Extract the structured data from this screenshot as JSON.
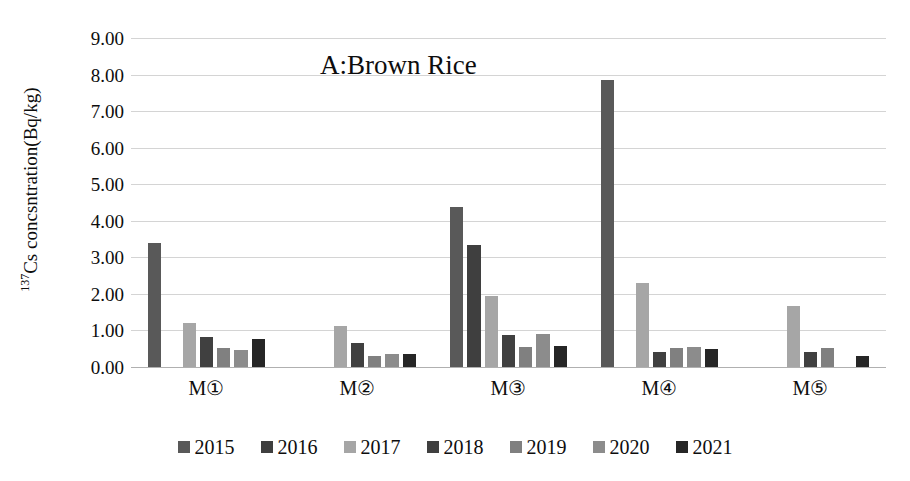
{
  "chart_data": {
    "type": "bar",
    "title": "A:Brown Rice",
    "xlabel": "",
    "ylabel_prefix": "137",
    "ylabel_rest": "Cs concsntration(Bq/kg)",
    "ylabel_plain": "137Cs concsntration(Bq/kg)",
    "categories": [
      "M①",
      "M②",
      "M③",
      "M④",
      "M⑤"
    ],
    "ylim": [
      0,
      9
    ],
    "ytick_labels": [
      "0.00",
      "1.00",
      "2.00",
      "3.00",
      "4.00",
      "5.00",
      "6.00",
      "7.00",
      "8.00",
      "9.00"
    ],
    "ytick_values": [
      0,
      1,
      2,
      3,
      4,
      5,
      6,
      7,
      8,
      9
    ],
    "grid": true,
    "legend_position": "bottom",
    "series": [
      {
        "name": "2015",
        "color": "#595959",
        "values": [
          3.4,
          null,
          4.37,
          7.85,
          null
        ]
      },
      {
        "name": "2016",
        "color": "#3f3f3f",
        "values": [
          null,
          null,
          3.35,
          null,
          null
        ]
      },
      {
        "name": "2017",
        "color": "#a6a6a6",
        "values": [
          1.2,
          1.12,
          1.93,
          2.3,
          1.67
        ]
      },
      {
        "name": "2018",
        "color": "#404040",
        "values": [
          0.82,
          0.67,
          0.88,
          0.4,
          0.4
        ]
      },
      {
        "name": "2019",
        "color": "#808080",
        "values": [
          0.52,
          0.3,
          0.55,
          0.52,
          0.53
        ]
      },
      {
        "name": "2020",
        "color": "#8c8c8c",
        "values": [
          0.46,
          0.36,
          0.9,
          0.55,
          null
        ]
      },
      {
        "name": "2021",
        "color": "#262626",
        "values": [
          0.77,
          0.35,
          0.57,
          0.5,
          0.3
        ]
      }
    ]
  }
}
